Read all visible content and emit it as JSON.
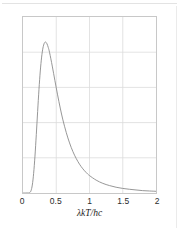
{
  "figure": {
    "background_color": "#ffffff",
    "frame_color": "#c8c8c8",
    "grid_color": "#dcdcdc",
    "curve_color": "#8a8a8a",
    "width": 179,
    "height": 231
  },
  "chart_data": {
    "type": "line",
    "title": "",
    "subtitle": "",
    "xlabel": "λkT/hc",
    "ylabel": "ρ/{8π(kT)⁵/(hc)⁴}",
    "xlim": [
      0,
      2
    ],
    "ylim": [
      0,
      1.04
    ],
    "xticks": [
      0,
      0.5,
      1,
      1.5,
      2
    ],
    "xtick_labels": [
      "0",
      "0.5",
      "1",
      "1.5",
      "2"
    ],
    "yticks": [],
    "ytick_labels": [],
    "grid": true,
    "grid_x_values": [
      0.5,
      1.0,
      1.5
    ],
    "grid_y_fractions": [
      0.2,
      0.4,
      0.6,
      0.8
    ],
    "legend": false,
    "legend_position": "none",
    "annotations": [],
    "series": [
      {
        "name": "Planck distribution",
        "color": "#8a8a8a",
        "linewidth": 0.9,
        "peak_x": 0.28,
        "peak_y": 1.0,
        "x": [
          0.0,
          0.02,
          0.04,
          0.06,
          0.08,
          0.1,
          0.12,
          0.14,
          0.16,
          0.18,
          0.2,
          0.22,
          0.24,
          0.26,
          0.28,
          0.3,
          0.32,
          0.34,
          0.36,
          0.38,
          0.4,
          0.44,
          0.48,
          0.52,
          0.56,
          0.6,
          0.65,
          0.7,
          0.75,
          0.8,
          0.85,
          0.9,
          0.95,
          1.0,
          1.1,
          1.2,
          1.3,
          1.4,
          1.5,
          1.6,
          1.7,
          1.8,
          1.9,
          2.0
        ],
        "y": [
          0.0,
          0.0,
          0.0,
          0.0,
          0.0,
          0.002,
          0.013,
          0.047,
          0.116,
          0.218,
          0.345,
          0.481,
          0.611,
          0.721,
          0.803,
          0.857,
          0.885,
          0.892,
          0.882,
          0.86,
          0.829,
          0.75,
          0.664,
          0.58,
          0.502,
          0.432,
          0.358,
          0.296,
          0.245,
          0.204,
          0.17,
          0.143,
          0.121,
          0.103,
          0.076,
          0.057,
          0.044,
          0.034,
          0.027,
          0.022,
          0.018,
          0.014,
          0.012,
          0.01
        ]
      }
    ]
  },
  "axis": {
    "x_title_parts": {
      "lambda": "λ",
      "k": "k",
      "T": "T",
      "slash": "/",
      "hc": "hc"
    },
    "y_title_text": "ρ/{8π(kT)5/(hc)4}"
  }
}
